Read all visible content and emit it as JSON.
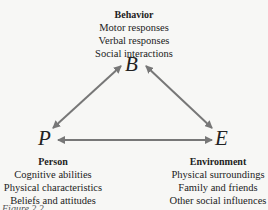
{
  "diagram": {
    "nodes": {
      "B": {
        "letter": "B",
        "title": "Behavior",
        "items": [
          "Motor responses",
          "Verbal responses",
          "Social interactions"
        ]
      },
      "P": {
        "letter": "P",
        "title": "Person",
        "items": [
          "Cognitive abilities",
          "Physical characteristics",
          "Beliefs and attitudes"
        ]
      },
      "E": {
        "letter": "E",
        "title": "Environment",
        "items": [
          "Physical surroundings",
          "Family and friends",
          "Other social influences"
        ]
      }
    },
    "edges": [
      {
        "from": "B",
        "to": "P",
        "direction": "bidirectional"
      },
      {
        "from": "B",
        "to": "E",
        "direction": "bidirectional"
      },
      {
        "from": "P",
        "to": "E",
        "direction": "bidirectional"
      }
    ],
    "arrow_color": "#777777",
    "caption": "Figure 2.2"
  }
}
